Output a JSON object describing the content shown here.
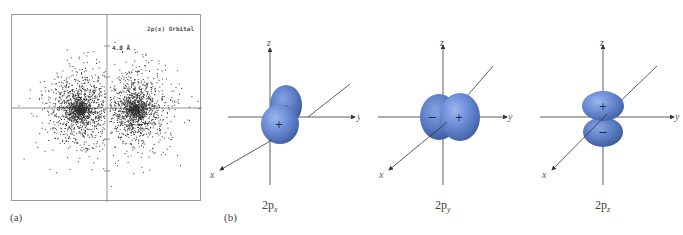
{
  "panel_a": {
    "label": "(a)",
    "title": "2p(x) Orbital",
    "scale_label": "4.0 Å",
    "description": "electron density dot plot of a 2p(x) orbital with two lobes on either side of the vertical axis"
  },
  "panel_b": {
    "label": "(b)",
    "orbitals": [
      {
        "name_main": "2p",
        "name_sub": "x",
        "axes": {
          "x": "x",
          "y": "y",
          "z": "z"
        },
        "lobes": [
          {
            "sign": "+"
          },
          {
            "sign": "−"
          }
        ]
      },
      {
        "name_main": "2p",
        "name_sub": "y",
        "axes": {
          "x": "x",
          "y": "y",
          "z": "z"
        },
        "lobes": [
          {
            "sign": "−"
          },
          {
            "sign": "+"
          }
        ]
      },
      {
        "name_main": "2p",
        "name_sub": "z",
        "axes": {
          "x": "x",
          "y": "y",
          "z": "z"
        },
        "lobes": [
          {
            "sign": "+"
          },
          {
            "sign": "−"
          }
        ]
      }
    ]
  },
  "colors": {
    "lobe_light": "#86a6e6",
    "lobe_mid": "#6a8cd6",
    "lobe_dark": "#3f5fa8",
    "axis": "#333333",
    "frame": "#9a9a9a"
  }
}
